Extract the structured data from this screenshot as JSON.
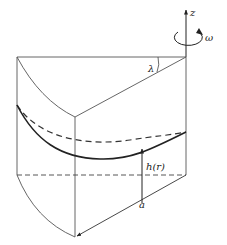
{
  "diagram": {
    "type": "rotating-fluid-wedge",
    "labels": {
      "axis": "z",
      "angular_velocity": "ω",
      "wedge_angle": "λ",
      "height": "h(r)",
      "radius": "a"
    },
    "colors": {
      "line": "#333333",
      "thin_line": "#555555",
      "background": "#ffffff"
    },
    "elements": [
      "rotation axis z with arrow",
      "rotation arrow ω",
      "wedge container outline",
      "free surface (solid curve)",
      "initial level (dashed curve)",
      "base level (dashed line)",
      "height arrow h(r)",
      "radius arrow a"
    ]
  }
}
